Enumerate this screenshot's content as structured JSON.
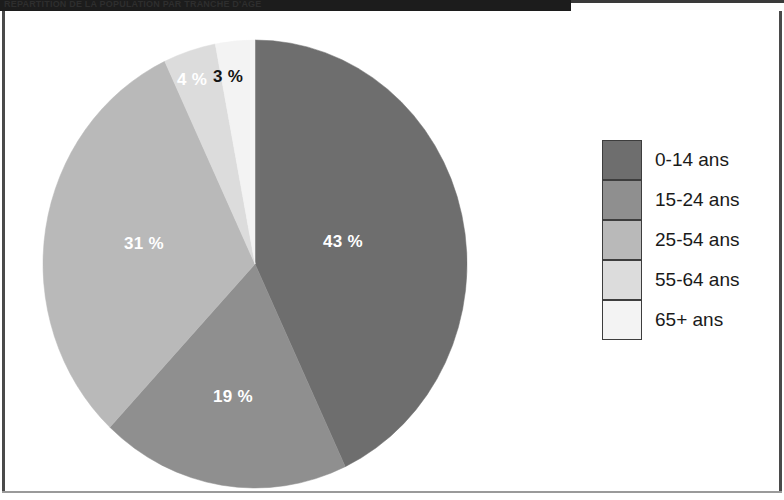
{
  "header": {
    "title": "REPARTITION DE LA POPULATION PAR TRANCHE D'AGE"
  },
  "legend": {
    "position": "right",
    "items": [
      {
        "label": "0-14 ans",
        "color": "#6e6e6e"
      },
      {
        "label": "15-24 ans",
        "color": "#8f8f8f"
      },
      {
        "label": "25-54 ans",
        "color": "#b9b9b9"
      },
      {
        "label": "55-64 ans",
        "color": "#dcdcdc"
      },
      {
        "label": "65+ ans",
        "color": "#f3f3f3"
      }
    ]
  },
  "chart_data": {
    "type": "pie",
    "title": "",
    "xlabel": "",
    "ylabel": "",
    "legend_position": "right",
    "grid": false,
    "start_angle_deg": 0,
    "direction": "clockwise",
    "categories": [
      "0-14 ans",
      "15-24 ans",
      "25-54 ans",
      "55-64 ans",
      "65+ ans"
    ],
    "values": [
      43,
      19,
      31,
      4,
      3
    ],
    "value_unit": "%",
    "slices": [
      {
        "label": "0-14 ans",
        "value": 43,
        "data_label": "43 %",
        "color": "#6e6e6e",
        "label_color": "light",
        "label_x": 318,
        "label_y": 220
      },
      {
        "label": "15-24 ans",
        "value": 19,
        "data_label": "19 %",
        "color": "#8f8f8f",
        "label_color": "light",
        "label_x": 208,
        "label_y": 375
      },
      {
        "label": "25-54 ans",
        "value": 31,
        "data_label": "31 %",
        "color": "#b9b9b9",
        "label_color": "light",
        "label_x": 119,
        "label_y": 222
      },
      {
        "label": "55-64 ans",
        "value": 4,
        "data_label": "4 %",
        "color": "#dcdcdc",
        "label_color": "light",
        "label_x": 172,
        "label_y": 58
      },
      {
        "label": "65+ ans",
        "value": 3,
        "data_label": "3 %",
        "color": "#f3f3f3",
        "label_color": "dark",
        "label_x": 208,
        "label_y": 55
      }
    ],
    "geometry": {
      "center_x": 250,
      "center_y": 252,
      "radius_x": 212,
      "radius_y": 224
    }
  }
}
